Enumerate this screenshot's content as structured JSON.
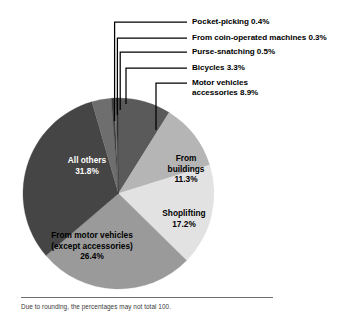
{
  "chart_data": {
    "type": "pie",
    "title": "",
    "subtitle": "",
    "note": "Due to rounding, the percentages may not total 100.",
    "units": "percent",
    "legend_position": "callout-labels",
    "grid": false,
    "categories": [
      "Motor vehicles accessories",
      "From buildings",
      "Shoplifting",
      "From motor vehicles (except accessories)",
      "All others",
      "Bicycles",
      "Purse-snatching",
      "From coin-operated machines",
      "Pocket-picking"
    ],
    "values": [
      8.9,
      11.3,
      17.2,
      26.4,
      31.8,
      3.3,
      0.5,
      0.3,
      0.4
    ],
    "slices": [
      {
        "label": "Motor vehicles accessories",
        "value": 8.9,
        "display": "8.9%",
        "color": "#5a5a5a",
        "label_style": "callout"
      },
      {
        "label": "From buildings",
        "value": 11.3,
        "display": "11.3%",
        "color": "#b5b5b5",
        "label_style": "inside"
      },
      {
        "label": "Shoplifting",
        "value": 17.2,
        "display": "17.2%",
        "color": "#e2e2e2",
        "label_style": "inside"
      },
      {
        "label": "From motor vehicles (except accessories)",
        "value": 26.4,
        "display": "26.4%",
        "color": "#9a9a9a",
        "label_style": "inside"
      },
      {
        "label": "All others",
        "value": 31.8,
        "display": "31.8%",
        "color": "#454545",
        "label_style": "inside"
      },
      {
        "label": "Bicycles",
        "value": 3.3,
        "display": "3.3%",
        "color": "#6e6e6e",
        "label_style": "callout"
      },
      {
        "label": "Purse-snatching",
        "value": 0.5,
        "display": "0.5%",
        "color": "#3c3c3c",
        "label_style": "callout"
      },
      {
        "label": "From coin-operated machines",
        "value": 0.3,
        "display": "0.3%",
        "color": "#727272",
        "label_style": "callout"
      },
      {
        "label": "Pocket-picking",
        "value": 0.4,
        "display": "0.4%",
        "color": "#2e2e2e",
        "label_style": "callout"
      }
    ]
  },
  "callouts": [
    {
      "text": "Pocket-picking 0.4%"
    },
    {
      "text": "From coin-operated machines 0.3%"
    },
    {
      "text": "Purse-snatching 0.5%"
    },
    {
      "text": "Bicycles 3.3%"
    },
    {
      "text_line1": "Motor vehicles",
      "text_line2": "accessories 8.9%"
    }
  ],
  "inside_labels": {
    "all_others": {
      "line1": "All others",
      "line2": "31.8%"
    },
    "from_buildings": {
      "line1": "From",
      "line2": "buildings",
      "line3": "11.3%"
    },
    "shoplifting": {
      "line1": "Shoplifting",
      "line2": "17.2%"
    },
    "from_motor_vehicles": {
      "line1": "From motor vehicles",
      "line2": "(except accessories)",
      "line3": "26.4%"
    }
  },
  "footnote": {
    "text": "Due to rounding, the percentages may not total 100."
  },
  "colors": {
    "background": "#ffffff",
    "leader_line": "#000000",
    "footnote_rule": "#6f6f6f",
    "text": "#000000"
  }
}
